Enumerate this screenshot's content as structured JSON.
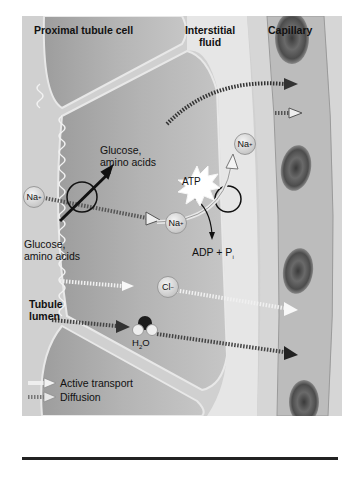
{
  "regions": {
    "proximal_cell": "Proximal tubule cell",
    "interstitial": [
      "Interstitial",
      "fluid"
    ],
    "capillary": "Capillary",
    "lumen": [
      "Tubule",
      "lumen"
    ]
  },
  "labels": {
    "glucose_top": [
      "Glucose,",
      "amino acids"
    ],
    "glucose_bottom": [
      "Glucose,",
      "amino acids"
    ],
    "na_lumen": "Na",
    "na_cell": "Na",
    "na_interstitial": "Na",
    "plus": "+",
    "atp": "ATP",
    "adp": "ADP + P",
    "adp_sub": "i",
    "cl": "Cl",
    "minus": "−",
    "h2o_h": "H",
    "h2o_2": "2",
    "h2o_o": "O"
  },
  "legend": {
    "active": "Active transport",
    "diffusion": "Diffusion"
  },
  "colors": {
    "lumen": "#cfcfcf",
    "cell": "#b8b8b8",
    "interstitial": "#e4e4e4",
    "capillary_wall": "#d2d2d2",
    "capillary_lumen": "#bdbdbd",
    "rbc": "#5a5a5a",
    "arrow_dark": "#3a3a3a"
  }
}
